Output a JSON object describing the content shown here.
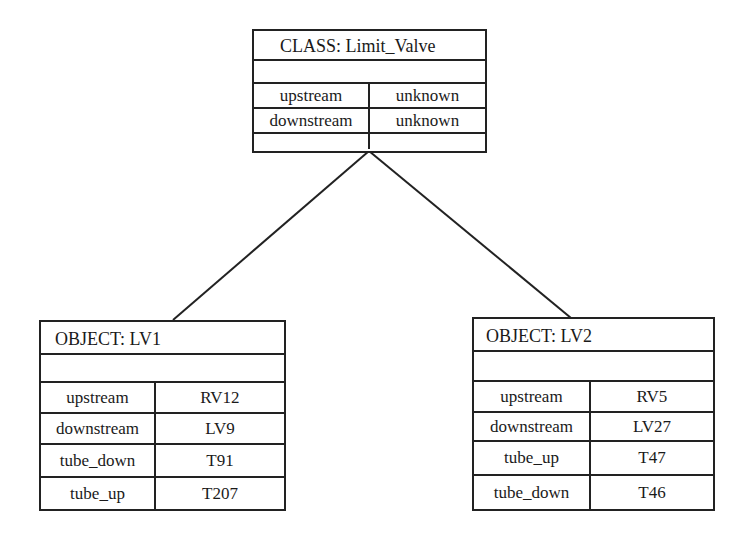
{
  "class_box": {
    "title": "CLASS:   Limit_Valve",
    "slots": [
      {
        "name": "upstream",
        "value": "unknown"
      },
      {
        "name": "downstream",
        "value": "unknown"
      },
      {
        "name": "",
        "value": ""
      }
    ]
  },
  "objects": [
    {
      "title": "OBJECT:  LV1",
      "slots": [
        {
          "name": "upstream",
          "value": "RV12"
        },
        {
          "name": "downstream",
          "value": "LV9"
        },
        {
          "name": "tube_down",
          "value": "T91"
        },
        {
          "name": "tube_up",
          "value": "T207"
        }
      ]
    },
    {
      "title": "OBJECT:  LV2",
      "slots": [
        {
          "name": "upstream",
          "value": "RV5"
        },
        {
          "name": "downstream",
          "value": "LV27"
        },
        {
          "name": "tube_up",
          "value": "T47"
        },
        {
          "name": "tube_down",
          "value": "T46"
        }
      ]
    }
  ],
  "links": [
    {
      "from": "class_box",
      "to": "objects.0"
    },
    {
      "from": "class_box",
      "to": "objects.1"
    }
  ]
}
